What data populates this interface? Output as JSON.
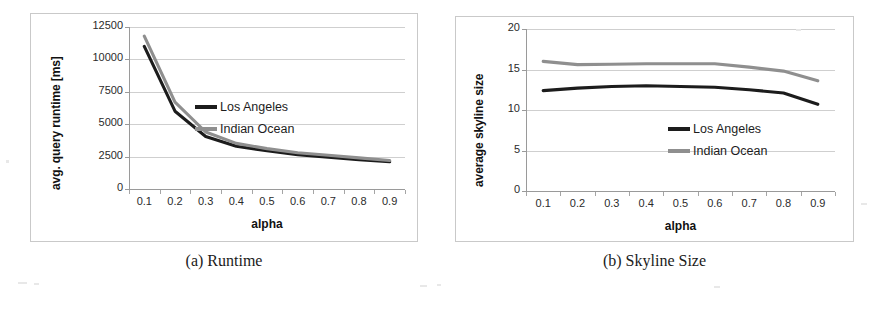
{
  "figure": {
    "panels": [
      {
        "caption": "(a) Runtime",
        "xlabel": "alpha",
        "ylabel": "avg. query runtime [ms]"
      },
      {
        "caption": "(b) Skyline Size",
        "xlabel": "alpha",
        "ylabel": "average skyline size"
      }
    ]
  },
  "colors": {
    "los_angeles": "#1c1c1c",
    "indian_ocean": "#8f8f8f",
    "gridline": "#cfcfcf",
    "axis": "#9a9a9a",
    "box_border": "#c9c9c9"
  },
  "legend": {
    "position": "center-right",
    "entries": [
      {
        "label": "Los Angeles",
        "color": "#1c1c1c"
      },
      {
        "label": "Indian Ocean",
        "color": "#8f8f8f"
      }
    ]
  },
  "chart_data": [
    {
      "type": "line",
      "title": "(a) Runtime",
      "xlabel": "alpha",
      "ylabel": "avg. query runtime [ms]",
      "x": [
        0.1,
        0.2,
        0.3,
        0.4,
        0.5,
        0.6,
        0.7,
        0.8,
        0.9
      ],
      "categories": [
        "0.1",
        "0.2",
        "0.3",
        "0.4",
        "0.5",
        "0.6",
        "0.7",
        "0.8",
        "0.9"
      ],
      "xlim": [
        0.05,
        0.95
      ],
      "ylim": [
        0,
        12500
      ],
      "yticks": [
        0,
        2500,
        5000,
        7500,
        10000,
        12500
      ],
      "ytick_labels": [
        "0",
        "2500",
        "5000",
        "7500",
        "10000",
        "12500"
      ],
      "xtick_labels": [
        "0.1",
        "0.2",
        "0.3",
        "0.4",
        "0.5",
        "0.6",
        "0.7",
        "0.8",
        "0.9"
      ],
      "grid": true,
      "legend_position": "center-right",
      "series": [
        {
          "name": "Los Angeles",
          "color": "#1c1c1c",
          "values": [
            11000,
            6000,
            4050,
            3300,
            2950,
            2650,
            2450,
            2250,
            2100
          ]
        },
        {
          "name": "Indian Ocean",
          "color": "#8f8f8f",
          "values": [
            11800,
            6700,
            4400,
            3520,
            3120,
            2800,
            2600,
            2400,
            2200
          ]
        }
      ]
    },
    {
      "type": "line",
      "title": "(b) Skyline Size",
      "xlabel": "alpha",
      "ylabel": "average skyline size",
      "x": [
        0.1,
        0.2,
        0.3,
        0.4,
        0.5,
        0.6,
        0.7,
        0.8,
        0.9
      ],
      "categories": [
        "0.1",
        "0.2",
        "0.3",
        "0.4",
        "0.5",
        "0.6",
        "0.7",
        "0.8",
        "0.9"
      ],
      "xlim": [
        0.05,
        0.95
      ],
      "ylim": [
        0,
        20
      ],
      "yticks": [
        0,
        5,
        10,
        15,
        20
      ],
      "ytick_labels": [
        "0",
        "5",
        "10",
        "15",
        "20"
      ],
      "xtick_labels": [
        "0.1",
        "0.2",
        "0.3",
        "0.4",
        "0.5",
        "0.6",
        "0.7",
        "0.8",
        "0.9"
      ],
      "grid": true,
      "legend_position": "center-right",
      "series": [
        {
          "name": "Los Angeles",
          "color": "#1c1c1c",
          "values": [
            12.4,
            12.7,
            12.9,
            13.0,
            12.9,
            12.8,
            12.5,
            12.1,
            10.7
          ]
        },
        {
          "name": "Indian Ocean",
          "color": "#8f8f8f",
          "values": [
            16.0,
            15.6,
            15.65,
            15.7,
            15.7,
            15.7,
            15.3,
            14.8,
            13.6
          ]
        }
      ]
    }
  ]
}
